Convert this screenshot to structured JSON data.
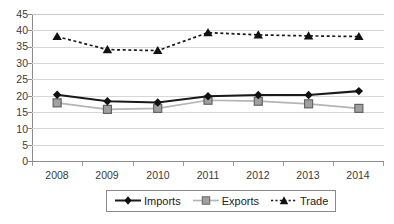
{
  "chart_data": {
    "type": "line",
    "title": "",
    "subtitle": "",
    "xlabel": "",
    "ylabel": "",
    "categories": [
      "2008",
      "2009",
      "2010",
      "2011",
      "2012",
      "2013",
      "2014"
    ],
    "ylim": [
      0,
      45
    ],
    "y_ticks": [
      0,
      5,
      10,
      15,
      20,
      25,
      30,
      35,
      40,
      45
    ],
    "grid": true,
    "legend_position": "bottom",
    "series": [
      {
        "name": "Imports",
        "marker": "diamond",
        "line_style": "solid",
        "color": "#1a1a1a",
        "values": [
          20.3,
          18.3,
          17.9,
          19.8,
          20.2,
          20.2,
          21.4
        ]
      },
      {
        "name": "Exports",
        "marker": "square",
        "line_style": "solid",
        "color": "#8c8c8c",
        "values": [
          17.8,
          15.8,
          16.1,
          18.6,
          18.3,
          17.5,
          16.1
        ]
      },
      {
        "name": "Trade",
        "marker": "triangle",
        "line_style": "dashed",
        "color": "#1a1a1a",
        "values": [
          38.1,
          34.1,
          33.8,
          39.3,
          38.6,
          38.3,
          38.1
        ]
      }
    ]
  },
  "axis": {
    "y_tick_labels": [
      "45",
      "40",
      "35",
      "30",
      "25",
      "20",
      "15",
      "10",
      "5",
      "0"
    ],
    "x_tick_labels": [
      "2008",
      "2009",
      "2010",
      "2011",
      "2012",
      "2013",
      "2014"
    ]
  },
  "legend": {
    "items": [
      {
        "label": "Imports",
        "key": "diamond-line-key"
      },
      {
        "label": "Exports",
        "key": "square-line-key"
      },
      {
        "label": "Trade",
        "key": "triangle-dashed-line-key"
      }
    ]
  },
  "colors": {
    "imports": "#1a1a1a",
    "exports": "#8c8c8c",
    "exports_fill": "#a0a0a0",
    "trade": "#1a1a1a",
    "grid": "#d7d7d7",
    "axis": "#8c8c8c",
    "text": "#3a3a3a",
    "background": "#ffffff"
  }
}
